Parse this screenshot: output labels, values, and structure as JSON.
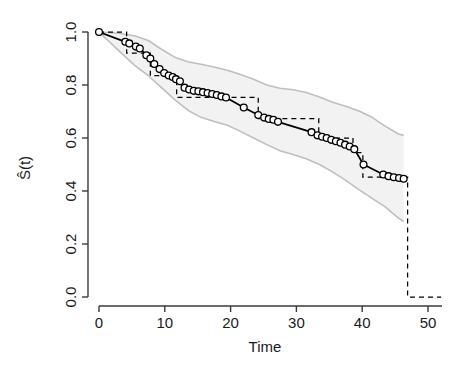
{
  "chart_data": {
    "type": "line",
    "title": "",
    "xlabel": "Time",
    "ylabel": "Ŝ(t)",
    "xlim": [
      -1.5,
      52.5
    ],
    "ylim": [
      -0.03,
      1.03
    ],
    "grid": false,
    "legend": "none",
    "xticks": [
      0,
      10,
      20,
      30,
      40,
      50
    ],
    "xtick_labels": [
      "0",
      "10",
      "20",
      "30",
      "40",
      "50"
    ],
    "yticks": [
      0.0,
      0.2,
      0.4,
      0.6,
      0.8,
      1.0
    ],
    "ytick_labels": [
      "0.0",
      "0.2",
      "0.4",
      "0.6",
      "0.8",
      "1.0"
    ],
    "colors": {
      "fitted_line": "#000000",
      "marker_stroke": "#000000",
      "marker_fill": "#ffffff",
      "km_step_line": "#000000",
      "band_fill": "#f2f2f2",
      "band_border": "#bfbfbf",
      "axis": "#3a3a3a",
      "text": "#1a1a1a"
    },
    "series": [
      {
        "name": "fitted-survival-curve",
        "style": "solid-with-open-circle-markers",
        "x": [
          0,
          4,
          4.6,
          5.6,
          6.2,
          7.2,
          7.8,
          8.4,
          9.2,
          9.9,
          10.6,
          11.2,
          11.7,
          12.3,
          13,
          13.7,
          14.4,
          15.1,
          15.8,
          16.5,
          17.2,
          17.9,
          18.6,
          19.3,
          22,
          24.2,
          25.1,
          25.8,
          26.5,
          27.2,
          32.3,
          33.2,
          33.9,
          34.6,
          35.3,
          36,
          36.7,
          37.4,
          38.1,
          38.8,
          40.2,
          43.2,
          44,
          44.8,
          45.6,
          46.3
        ],
        "y": [
          1.0,
          0.963,
          0.957,
          0.945,
          0.938,
          0.912,
          0.9,
          0.879,
          0.86,
          0.845,
          0.836,
          0.83,
          0.822,
          0.814,
          0.79,
          0.783,
          0.778,
          0.776,
          0.773,
          0.77,
          0.766,
          0.762,
          0.757,
          0.753,
          0.715,
          0.687,
          0.677,
          0.672,
          0.669,
          0.661,
          0.622,
          0.61,
          0.605,
          0.6,
          0.593,
          0.588,
          0.582,
          0.575,
          0.568,
          0.558,
          0.5,
          0.462,
          0.456,
          0.452,
          0.449,
          0.446
        ]
      },
      {
        "name": "kaplan-meier-step-curve",
        "style": "dashed-step",
        "x": [
          0,
          4.2,
          4.2,
          7.8,
          7.8,
          9.2,
          9.2,
          11.8,
          11.8,
          24.2,
          24.2,
          25.3,
          25.3,
          27.5,
          27.5,
          33.4,
          33.4,
          38.6,
          38.6,
          40.1,
          40.1,
          46.9,
          46.9,
          52
        ],
        "y": [
          1.0,
          1.0,
          0.92,
          0.92,
          0.835,
          0.835,
          0.835,
          0.835,
          0.753,
          0.753,
          0.673,
          0.673,
          0.673,
          0.673,
          0.673,
          0.673,
          0.6,
          0.6,
          0.545,
          0.545,
          0.452,
          0.452,
          0.0,
          0.0
        ]
      },
      {
        "name": "confidence-band-upper",
        "style": "gray-border",
        "x": [
          0,
          3,
          5.5,
          7.5,
          9.5,
          11.5,
          13.5,
          15.5,
          17.5,
          19.5,
          21.5,
          23.5,
          25.5,
          27.5,
          29.5,
          31.5,
          33.5,
          35.5,
          37.5,
          39.5,
          41.5,
          43.5,
          45.5,
          46.3
        ],
        "y": [
          1.0,
          0.995,
          0.985,
          0.968,
          0.935,
          0.905,
          0.888,
          0.878,
          0.868,
          0.856,
          0.84,
          0.822,
          0.8,
          0.788,
          0.782,
          0.772,
          0.755,
          0.735,
          0.72,
          0.702,
          0.678,
          0.645,
          0.615,
          0.61
        ]
      },
      {
        "name": "confidence-band-lower",
        "style": "gray-border",
        "x": [
          0,
          3,
          5.5,
          7.5,
          9.5,
          11.5,
          13.5,
          15.5,
          17.5,
          19.5,
          21.5,
          23.5,
          25.5,
          27.5,
          29.5,
          31.5,
          33.5,
          35.5,
          37.5,
          39.5,
          41.5,
          43.5,
          45.5,
          46.3
        ],
        "y": [
          1.0,
          0.93,
          0.872,
          0.835,
          0.79,
          0.745,
          0.705,
          0.678,
          0.662,
          0.648,
          0.625,
          0.6,
          0.575,
          0.552,
          0.538,
          0.522,
          0.5,
          0.472,
          0.44,
          0.405,
          0.372,
          0.34,
          0.298,
          0.285
        ]
      }
    ]
  }
}
